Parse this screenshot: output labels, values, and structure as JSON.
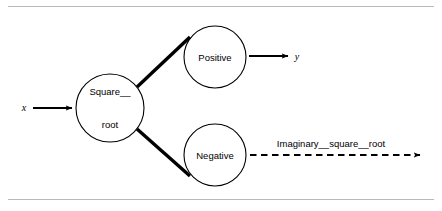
{
  "figure": {
    "background_color": "#ffffff",
    "rule_color": "#b9b9b9",
    "stroke_color": "#000000",
    "title": ""
  },
  "nodes": [
    {
      "id": "square-root",
      "label_line1": "Square__",
      "label_line2": "root",
      "cx": 110,
      "cy": 108,
      "r": 34
    },
    {
      "id": "positive",
      "label_line1": "Positive",
      "label_line2": "",
      "cx": 215,
      "cy": 57,
      "r": 31
    },
    {
      "id": "negative",
      "label_line1": "Negative",
      "label_line2": "",
      "cx": 215,
      "cy": 155,
      "r": 31
    }
  ],
  "inputs": [
    {
      "id": "x",
      "label": "x",
      "x": 24,
      "y": 107
    }
  ],
  "outputs": [
    {
      "id": "y",
      "label": "y",
      "x": 297,
      "y": 56
    }
  ],
  "edges": [
    {
      "id": "square-root-to-positive",
      "style": "solid-thick",
      "label": ""
    },
    {
      "id": "square-root-to-negative",
      "style": "solid-thick",
      "label": ""
    },
    {
      "id": "input-x-to-square-root",
      "style": "solid-arrow",
      "label": ""
    },
    {
      "id": "positive-to-y",
      "style": "solid-arrow",
      "label": ""
    },
    {
      "id": "negative-to-imaginary",
      "style": "dashed-arrow",
      "label": "Imaginary__square__root",
      "label_x": 331,
      "label_y": 143
    }
  ]
}
